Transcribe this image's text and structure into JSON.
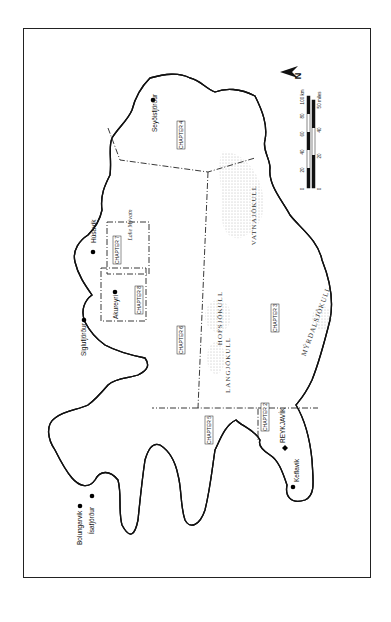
{
  "map": {
    "orientation": "rotated 90° clockwise (north points right)",
    "north_arrow": {
      "label": "N"
    },
    "scale_bar": {
      "km": {
        "unit_label": "100 km",
        "ticks": [
          "0",
          "20",
          "40",
          "60",
          "80",
          "100 km"
        ]
      },
      "miles": {
        "unit_label": "50 miles",
        "ticks": [
          "0",
          "20",
          "40",
          "50 miles"
        ]
      }
    },
    "towns": [
      {
        "name": "Seyðisfjörður"
      },
      {
        "name": "Húsavík"
      },
      {
        "name": "Akureyri"
      },
      {
        "name": "Siglufjörður"
      },
      {
        "name": "Bolungarvík"
      },
      {
        "name": "Ísafjörður"
      },
      {
        "name": "REYKJAVÍK",
        "capital": true
      },
      {
        "name": "Keflavík"
      }
    ],
    "chapters": [
      {
        "label": "CHAPTER 2"
      },
      {
        "label": "CHAPTER 3"
      },
      {
        "label": "CHAPTER 4"
      },
      {
        "label": "CHAPTER 5"
      },
      {
        "label": "CHAPTER 6"
      },
      {
        "label": "CHAPTER 7"
      },
      {
        "label": "CHAPTER 8"
      }
    ],
    "glaciers": [
      {
        "name": "VATNAJÖKULL"
      },
      {
        "name": "HOFSJÖKULL"
      },
      {
        "name": "LANGJÖKULL"
      },
      {
        "name": "MÝRDALSJÖKULL"
      }
    ],
    "lakes": [
      {
        "name": "Lake Mývatn"
      }
    ]
  }
}
